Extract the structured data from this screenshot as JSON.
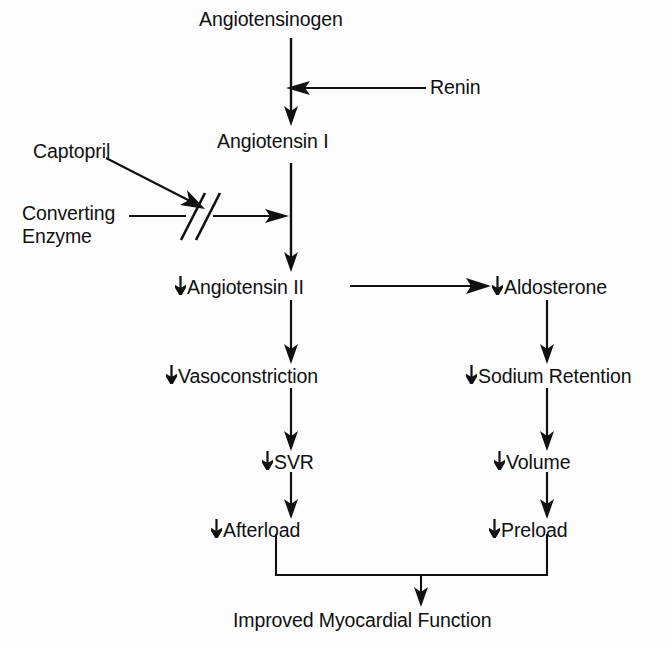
{
  "diagram": {
    "type": "flowchart",
    "background_color": "#fdfdfd",
    "stroke_color": "#101010",
    "decrease_symbol": "↓",
    "nodes": [
      {
        "id": "angiotensinogen",
        "label": "Angiotensinogen",
        "decreased": false
      },
      {
        "id": "renin",
        "label": "Renin",
        "decreased": false
      },
      {
        "id": "captopril",
        "label": "Captopril",
        "decreased": false
      },
      {
        "id": "converting_enzyme_line1",
        "label": "Converting",
        "decreased": false
      },
      {
        "id": "converting_enzyme_line2",
        "label": "Enzyme",
        "decreased": false
      },
      {
        "id": "angiotensin_i",
        "label": "Angiotensin I",
        "decreased": false
      },
      {
        "id": "angiotensin_ii",
        "label": "Angiotensin II",
        "decreased": true
      },
      {
        "id": "aldosterone",
        "label": "Aldosterone",
        "decreased": true
      },
      {
        "id": "vasoconstriction",
        "label": "Vasoconstriction",
        "decreased": true
      },
      {
        "id": "sodium_retention",
        "label": "Sodium Retention",
        "decreased": true
      },
      {
        "id": "svr",
        "label": "SVR",
        "decreased": true
      },
      {
        "id": "volume",
        "label": "Volume",
        "decreased": true
      },
      {
        "id": "afterload",
        "label": "Afterload",
        "decreased": true
      },
      {
        "id": "preload",
        "label": "Preload",
        "decreased": true
      },
      {
        "id": "improved_myocardial_function",
        "label": "Improved Myocardial Function",
        "decreased": false
      }
    ],
    "edges": [
      {
        "from": "angiotensinogen",
        "to": "angiotensin_i",
        "kind": "arrow-down"
      },
      {
        "from": "renin",
        "to": "angiotensinogen-to-angiotensin_i",
        "kind": "arrow-left"
      },
      {
        "from": "converting_enzyme",
        "to": "angiotensin_i-to-angiotensin_ii",
        "kind": "arrow-right-blocked"
      },
      {
        "from": "captopril",
        "to": "converting_enzyme_blockade",
        "kind": "arrow-diagonal"
      },
      {
        "from": "angiotensin_i",
        "to": "angiotensin_ii",
        "kind": "arrow-down"
      },
      {
        "from": "angiotensin_ii",
        "to": "aldosterone",
        "kind": "arrow-right"
      },
      {
        "from": "angiotensin_ii",
        "to": "vasoconstriction",
        "kind": "arrow-down"
      },
      {
        "from": "vasoconstriction",
        "to": "svr",
        "kind": "arrow-down"
      },
      {
        "from": "svr",
        "to": "afterload",
        "kind": "arrow-down"
      },
      {
        "from": "aldosterone",
        "to": "sodium_retention",
        "kind": "arrow-down"
      },
      {
        "from": "sodium_retention",
        "to": "volume",
        "kind": "arrow-down"
      },
      {
        "from": "volume",
        "to": "preload",
        "kind": "arrow-down"
      },
      {
        "from": "afterload",
        "to": "improved_myocardial_function",
        "kind": "merge-down"
      },
      {
        "from": "preload",
        "to": "improved_myocardial_function",
        "kind": "merge-down"
      }
    ],
    "blockade": {
      "symbol": "//",
      "meaning": "inhibition of converting enzyme by Captopril"
    }
  }
}
